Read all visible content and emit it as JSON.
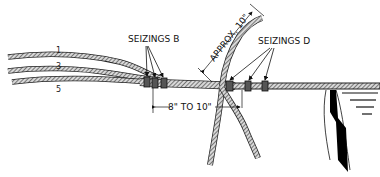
{
  "diagram": {
    "labels": {
      "seizings_b": "SEIZINGS B",
      "seizings_d": "SEIZINGS D",
      "approx": "APPROX. 10\"",
      "spacing": "8\" TO 10\""
    },
    "strand_numbers": [
      "1",
      "3",
      "5"
    ],
    "colors": {
      "rope_fill": "#cfcfcf",
      "rope_hatch": "#333333",
      "seizing": "#555555",
      "ink": "#111111"
    }
  }
}
